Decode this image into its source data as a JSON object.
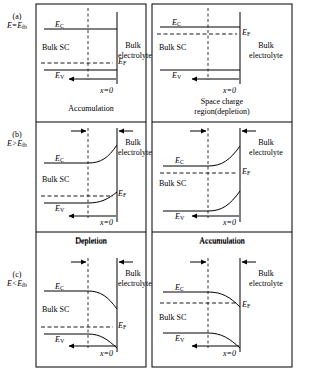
{
  "figure": {
    "type": "semiconductor-electrolyte band diagram",
    "rows": [
      {
        "id": "a",
        "index_label": "(a)",
        "condition": "E=E",
        "condition_sub": "fb",
        "condition_full": "E=E_fb",
        "panels": [
          {
            "side": "left",
            "caption": "Accumulation",
            "caption_line2": "",
            "bulk_sc_label": "Bulk SC",
            "electrolyte_label_line1": "Bulk",
            "electrolyte_label_line2": "electrolyte",
            "ec_label": "E",
            "ec_sub": "C",
            "ev_label": "E",
            "ev_sub": "V",
            "ef_label": "E",
            "ef_sub": "F",
            "x_label": "x=0",
            "band_shape": "flat",
            "fermi_position": "near-valence"
          },
          {
            "side": "right",
            "caption": "Space charge",
            "caption_line2": "region(depletion)",
            "bulk_sc_label": "Bulk SC",
            "electrolyte_label_line1": "Bulk",
            "electrolyte_label_line2": "electrolyte",
            "ec_label": "E",
            "ec_sub": "C",
            "ev_label": "E",
            "ev_sub": "V",
            "ef_label": "E",
            "ef_sub": "F",
            "x_label": "x=0",
            "band_shape": "flat",
            "fermi_position": "near-conduction"
          }
        ]
      },
      {
        "id": "b",
        "index_label": "(b)",
        "condition": "E>E",
        "condition_sub": "fb",
        "condition_full": "E>E_fb",
        "panels": [
          {
            "side": "left",
            "caption": "Depletion",
            "caption_line2": "",
            "bulk_sc_label": "Bulk SC",
            "electrolyte_label_line1": "Bulk",
            "electrolyte_label_line2": "electrolyte",
            "ec_label": "E",
            "ec_sub": "C",
            "ev_label": "E",
            "ev_sub": "V",
            "ef_label": "E",
            "ef_sub": "F",
            "x_label": "x=0",
            "band_shape": "upward",
            "fermi_position": "near-valence"
          },
          {
            "side": "right",
            "caption": "Accumulation",
            "caption_line2": "",
            "bulk_sc_label": "Bulk SC",
            "electrolyte_label_line1": "Bulk",
            "electrolyte_label_line2": "electrolyte",
            "ec_label": "E",
            "ec_sub": "C",
            "ev_label": "E",
            "ev_sub": "V",
            "ef_label": "E",
            "ef_sub": "F",
            "x_label": "x=0",
            "band_shape": "upward",
            "fermi_position": "near-conduction"
          }
        ]
      },
      {
        "id": "c",
        "index_label": "(c)",
        "condition": "E<E",
        "condition_sub": "fb",
        "condition_full": "E<E_fb",
        "panels": [
          {
            "side": "left",
            "caption": "",
            "caption_line2": "",
            "bulk_sc_label": "Bulk SC",
            "electrolyte_label_line1": "Bulk",
            "electrolyte_label_line2": "electrolyte",
            "ec_label": "E",
            "ec_sub": "C",
            "ev_label": "E",
            "ev_sub": "V",
            "ef_label": "E",
            "ef_sub": "F",
            "x_label": "x=0",
            "band_shape": "downward",
            "fermi_position": "near-valence"
          },
          {
            "side": "right",
            "caption": "",
            "caption_line2": "",
            "bulk_sc_label": "Bulk SC",
            "electrolyte_label_line1": "Bulk",
            "electrolyte_label_line2": "electrolyte",
            "ec_label": "E",
            "ec_sub": "C",
            "ev_label": "E",
            "ev_sub": "V",
            "ef_label": "E",
            "ef_sub": "F",
            "x_label": "x=0",
            "band_shape": "downward",
            "fermi_position": "near-conduction"
          }
        ]
      }
    ],
    "colors": {
      "line": "#000000",
      "background": "#ffffff",
      "border": "#000000"
    }
  }
}
